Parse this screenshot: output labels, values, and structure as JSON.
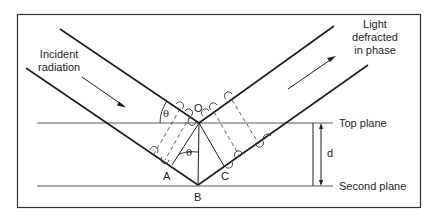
{
  "diagram": {
    "labels": {
      "incident_line1": "Incident",
      "incident_line2": "radiation",
      "diffracted_line1": "Light",
      "diffracted_line2": "defracted",
      "diffracted_line3": "in phase",
      "top_plane": "Top plane",
      "second_plane": "Second plane",
      "spacing": "d",
      "point_o": "O",
      "point_a": "A",
      "point_b": "B",
      "point_c": "C",
      "angle_upper": "θ",
      "angle_lower": "θ"
    },
    "colors": {
      "line": "#1e1e1e",
      "plane": "#555555",
      "frame": "#333333",
      "background": "#ffffff"
    }
  }
}
